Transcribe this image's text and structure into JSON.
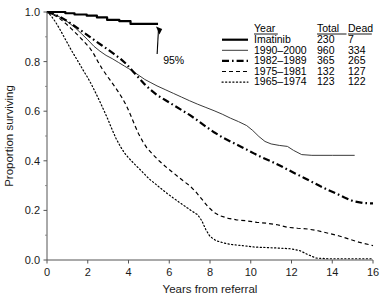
{
  "chart_data": {
    "type": "line",
    "title": "",
    "subtitle": "",
    "xlabel": "Years from referral",
    "ylabel": "Proportion surviving",
    "xlim": [
      0,
      16
    ],
    "ylim": [
      0.0,
      1.0
    ],
    "xticks": [
      "0",
      "2",
      "4",
      "6",
      "8",
      "10",
      "12",
      "14",
      "16"
    ],
    "xtick_values": [
      0,
      2,
      4,
      6,
      8,
      10,
      12,
      14,
      16
    ],
    "yticks": [
      "0.0",
      "0.2",
      "0.4",
      "0.6",
      "0.8",
      "1.0"
    ],
    "ytick_values": [
      0.0,
      0.2,
      0.4,
      0.6,
      0.8,
      1.0
    ],
    "grid": false,
    "legend_position": "top-right",
    "legend_columns": [
      "Year",
      "Total",
      "Dead"
    ],
    "annotations": [
      {
        "text": "95%",
        "x": 5.7,
        "y": 0.79,
        "arrow_to_x": 5.35,
        "arrow_to_y": 0.948
      }
    ],
    "series": [
      {
        "name": "Imatinib",
        "total": "230",
        "dead": "7",
        "linestyle": "solid",
        "linewidth": 2.2,
        "color": "#000000",
        "points": [
          [
            0.0,
            1.0
          ],
          [
            0.9,
            1.0
          ],
          [
            0.9,
            0.995
          ],
          [
            1.35,
            0.995
          ],
          [
            1.35,
            0.99
          ],
          [
            1.95,
            0.99
          ],
          [
            1.95,
            0.985
          ],
          [
            2.45,
            0.985
          ],
          [
            2.45,
            0.978
          ],
          [
            2.95,
            0.978
          ],
          [
            2.95,
            0.968
          ],
          [
            3.55,
            0.968
          ],
          [
            3.55,
            0.963
          ],
          [
            4.1,
            0.963
          ],
          [
            4.1,
            0.952
          ],
          [
            5.45,
            0.952
          ]
        ]
      },
      {
        "name": "1990–2000",
        "total": "960",
        "dead": "334",
        "linestyle": "solid",
        "linewidth": 1.0,
        "color": "#3a3a3a",
        "points": [
          [
            0.0,
            1.0
          ],
          [
            0.25,
            0.995
          ],
          [
            0.5,
            0.985
          ],
          [
            0.8,
            0.972
          ],
          [
            1.1,
            0.955
          ],
          [
            1.4,
            0.935
          ],
          [
            1.7,
            0.912
          ],
          [
            2.0,
            0.888
          ],
          [
            2.3,
            0.862
          ],
          [
            2.6,
            0.842
          ],
          [
            2.9,
            0.825
          ],
          [
            3.2,
            0.812
          ],
          [
            3.5,
            0.797
          ],
          [
            3.8,
            0.782
          ],
          [
            4.0,
            0.772
          ],
          [
            4.2,
            0.762
          ],
          [
            4.5,
            0.745
          ],
          [
            4.8,
            0.728
          ],
          [
            5.1,
            0.715
          ],
          [
            5.4,
            0.702
          ],
          [
            5.8,
            0.687
          ],
          [
            6.2,
            0.672
          ],
          [
            6.6,
            0.657
          ],
          [
            7.0,
            0.642
          ],
          [
            7.4,
            0.628
          ],
          [
            7.8,
            0.615
          ],
          [
            8.2,
            0.602
          ],
          [
            8.6,
            0.588
          ],
          [
            9.0,
            0.572
          ],
          [
            9.4,
            0.558
          ],
          [
            9.8,
            0.542
          ],
          [
            10.1,
            0.522
          ],
          [
            10.4,
            0.498
          ],
          [
            10.7,
            0.478
          ],
          [
            11.0,
            0.468
          ],
          [
            11.4,
            0.462
          ],
          [
            11.8,
            0.458
          ],
          [
            12.1,
            0.442
          ],
          [
            12.5,
            0.425
          ],
          [
            13.0,
            0.422
          ],
          [
            14.0,
            0.422
          ],
          [
            15.1,
            0.422
          ]
        ]
      },
      {
        "name": "1982–1989",
        "total": "365",
        "dead": "265",
        "linestyle": "dashdot",
        "linewidth": 2.2,
        "color": "#000000",
        "points": [
          [
            0.0,
            1.0
          ],
          [
            0.3,
            0.992
          ],
          [
            0.6,
            0.982
          ],
          [
            0.9,
            0.968
          ],
          [
            1.2,
            0.952
          ],
          [
            1.5,
            0.935
          ],
          [
            1.8,
            0.918
          ],
          [
            2.1,
            0.9
          ],
          [
            2.4,
            0.882
          ],
          [
            2.7,
            0.865
          ],
          [
            3.0,
            0.848
          ],
          [
            3.3,
            0.83
          ],
          [
            3.6,
            0.812
          ],
          [
            3.9,
            0.79
          ],
          [
            4.2,
            0.762
          ],
          [
            4.5,
            0.735
          ],
          [
            4.8,
            0.708
          ],
          [
            5.1,
            0.685
          ],
          [
            5.4,
            0.665
          ],
          [
            5.8,
            0.645
          ],
          [
            6.2,
            0.625
          ],
          [
            6.6,
            0.605
          ],
          [
            7.0,
            0.585
          ],
          [
            7.4,
            0.562
          ],
          [
            7.8,
            0.538
          ],
          [
            8.2,
            0.515
          ],
          [
            8.6,
            0.495
          ],
          [
            9.0,
            0.478
          ],
          [
            9.4,
            0.462
          ],
          [
            9.8,
            0.445
          ],
          [
            10.2,
            0.428
          ],
          [
            10.6,
            0.412
          ],
          [
            11.0,
            0.398
          ],
          [
            11.4,
            0.382
          ],
          [
            11.8,
            0.365
          ],
          [
            12.2,
            0.348
          ],
          [
            12.6,
            0.332
          ],
          [
            13.0,
            0.315
          ],
          [
            13.4,
            0.298
          ],
          [
            13.8,
            0.282
          ],
          [
            14.2,
            0.268
          ],
          [
            14.6,
            0.252
          ],
          [
            15.0,
            0.238
          ],
          [
            15.5,
            0.23
          ],
          [
            16.0,
            0.228
          ]
        ]
      },
      {
        "name": "1975–1981",
        "total": "132",
        "dead": "127",
        "linestyle": "dashed",
        "linewidth": 1.2,
        "color": "#000000",
        "points": [
          [
            0.0,
            1.0
          ],
          [
            0.3,
            0.99
          ],
          [
            0.6,
            0.975
          ],
          [
            0.9,
            0.955
          ],
          [
            1.2,
            0.932
          ],
          [
            1.5,
            0.908
          ],
          [
            1.8,
            0.882
          ],
          [
            2.1,
            0.855
          ],
          [
            2.3,
            0.83
          ],
          [
            2.5,
            0.8
          ],
          [
            2.7,
            0.772
          ],
          [
            2.9,
            0.748
          ],
          [
            3.1,
            0.725
          ],
          [
            3.3,
            0.702
          ],
          [
            3.5,
            0.678
          ],
          [
            3.7,
            0.652
          ],
          [
            3.9,
            0.622
          ],
          [
            4.1,
            0.585
          ],
          [
            4.3,
            0.545
          ],
          [
            4.5,
            0.508
          ],
          [
            4.7,
            0.478
          ],
          [
            4.9,
            0.452
          ],
          [
            5.2,
            0.425
          ],
          [
            5.5,
            0.4
          ],
          [
            5.8,
            0.378
          ],
          [
            6.1,
            0.358
          ],
          [
            6.4,
            0.338
          ],
          [
            6.7,
            0.318
          ],
          [
            7.0,
            0.3
          ],
          [
            7.3,
            0.275
          ],
          [
            7.6,
            0.245
          ],
          [
            7.9,
            0.215
          ],
          [
            8.2,
            0.192
          ],
          [
            8.5,
            0.178
          ],
          [
            8.9,
            0.168
          ],
          [
            9.3,
            0.162
          ],
          [
            9.8,
            0.158
          ],
          [
            10.3,
            0.152
          ],
          [
            10.8,
            0.148
          ],
          [
            11.3,
            0.142
          ],
          [
            11.8,
            0.132
          ],
          [
            12.3,
            0.128
          ],
          [
            12.8,
            0.125
          ],
          [
            13.3,
            0.118
          ],
          [
            13.8,
            0.108
          ],
          [
            14.3,
            0.098
          ],
          [
            14.8,
            0.085
          ],
          [
            15.3,
            0.072
          ],
          [
            15.8,
            0.062
          ],
          [
            16.0,
            0.058
          ]
        ]
      },
      {
        "name": "1965–1974",
        "total": "123",
        "dead": "122",
        "linestyle": "dotted",
        "linewidth": 1.2,
        "color": "#000000",
        "points": [
          [
            0.0,
            1.0
          ],
          [
            0.2,
            0.985
          ],
          [
            0.4,
            0.962
          ],
          [
            0.6,
            0.935
          ],
          [
            0.8,
            0.905
          ],
          [
            1.0,
            0.875
          ],
          [
            1.2,
            0.845
          ],
          [
            1.4,
            0.818
          ],
          [
            1.6,
            0.79
          ],
          [
            1.8,
            0.762
          ],
          [
            2.0,
            0.735
          ],
          [
            2.2,
            0.705
          ],
          [
            2.4,
            0.672
          ],
          [
            2.6,
            0.638
          ],
          [
            2.8,
            0.602
          ],
          [
            3.0,
            0.565
          ],
          [
            3.2,
            0.525
          ],
          [
            3.4,
            0.488
          ],
          [
            3.6,
            0.458
          ],
          [
            3.8,
            0.432
          ],
          [
            4.0,
            0.412
          ],
          [
            4.2,
            0.395
          ],
          [
            4.4,
            0.378
          ],
          [
            4.6,
            0.362
          ],
          [
            4.8,
            0.345
          ],
          [
            5.0,
            0.328
          ],
          [
            5.3,
            0.308
          ],
          [
            5.6,
            0.288
          ],
          [
            5.9,
            0.268
          ],
          [
            6.2,
            0.25
          ],
          [
            6.5,
            0.232
          ],
          [
            6.8,
            0.215
          ],
          [
            7.1,
            0.198
          ],
          [
            7.4,
            0.182
          ],
          [
            7.6,
            0.158
          ],
          [
            7.8,
            0.122
          ],
          [
            8.0,
            0.095
          ],
          [
            8.3,
            0.078
          ],
          [
            8.7,
            0.068
          ],
          [
            9.1,
            0.062
          ],
          [
            9.6,
            0.058
          ],
          [
            10.2,
            0.052
          ],
          [
            10.8,
            0.05
          ],
          [
            11.4,
            0.048
          ],
          [
            12.0,
            0.045
          ],
          [
            12.4,
            0.038
          ],
          [
            12.8,
            0.022
          ],
          [
            13.2,
            0.008
          ],
          [
            13.8,
            0.005
          ],
          [
            14.5,
            0.005
          ],
          [
            15.2,
            0.005
          ],
          [
            16.0,
            0.005
          ]
        ]
      }
    ]
  }
}
